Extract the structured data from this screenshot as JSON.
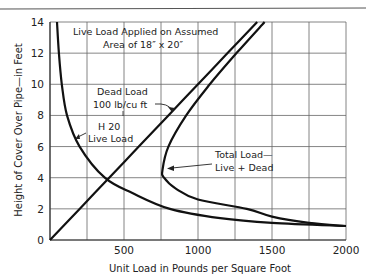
{
  "chart_data": {
    "type": "line",
    "title": "",
    "xlabel": "Unit Load in Pounds per Square Foot",
    "ylabel": "Height of Cover Over Pipe—in Feet",
    "xlim": [
      0,
      2000
    ],
    "ylim": [
      0,
      14
    ],
    "x_ticks": [
      500,
      1000,
      1500,
      2000
    ],
    "x_tick_labels": [
      "500",
      "1000",
      "1500",
      "2000"
    ],
    "y_ticks": [
      0,
      2,
      4,
      6,
      8,
      10,
      12,
      14
    ],
    "y_tick_labels": [
      "0",
      "2",
      "4",
      "6",
      "8",
      "10",
      "12",
      "14"
    ],
    "grid": true,
    "x_grid_step": 250,
    "y_grid_step": 2,
    "legend": "none",
    "annotations": [
      {
        "text": "Live Load Applied on Assumed",
        "line": 1
      },
      {
        "text": "Area of 18″ x 20″",
        "line": 2
      },
      {
        "text": "Dead Load",
        "line": 1,
        "target": "Dead Load"
      },
      {
        "text": "100 lb/cu ft",
        "line": 2,
        "target": "Dead Load"
      },
      {
        "text": "H 20",
        "line": 1,
        "target": "H 20 Live Load"
      },
      {
        "text": "Live Load",
        "line": 2,
        "target": "H 20 Live Load"
      },
      {
        "text": "Total Load—",
        "line": 1,
        "target": "Total Load"
      },
      {
        "text": "Live + Dead",
        "line": 2,
        "target": "Total Load"
      }
    ],
    "series": [
      {
        "name": "H 20 Live Load",
        "points": [
          [
            47,
            14
          ],
          [
            60,
            12
          ],
          [
            80,
            10
          ],
          [
            115,
            8
          ],
          [
            200,
            6
          ],
          [
            370,
            4
          ],
          [
            560,
            3
          ],
          [
            810,
            2
          ],
          [
            1150,
            1.4
          ],
          [
            1500,
            1.1
          ],
          [
            2000,
            0.9
          ]
        ]
      },
      {
        "name": "Dead Load",
        "points": [
          [
            0,
            0
          ],
          [
            200,
            2
          ],
          [
            400,
            4
          ],
          [
            600,
            6
          ],
          [
            800,
            8
          ],
          [
            1000,
            10
          ],
          [
            1200,
            12
          ],
          [
            1400,
            14
          ]
        ]
      },
      {
        "name": "Total Load",
        "points": [
          [
            1450,
            14
          ],
          [
            1260,
            12
          ],
          [
            1080,
            10
          ],
          [
            920,
            8
          ],
          [
            800,
            6
          ],
          [
            760,
            4.5
          ],
          [
            770,
            4
          ],
          [
            850,
            3.3
          ],
          [
            1000,
            2.6
          ],
          [
            1330,
            2
          ],
          [
            1500,
            1.5
          ],
          [
            1750,
            1.1
          ],
          [
            2000,
            0.9
          ]
        ]
      }
    ]
  }
}
